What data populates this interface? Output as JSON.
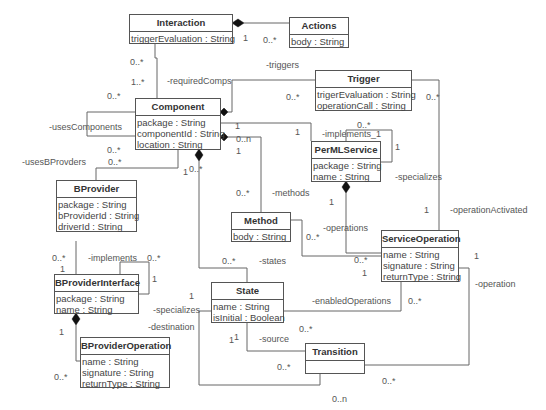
{
  "classes": {
    "interaction": {
      "name": "Interaction",
      "attrs": [
        "triggerEvaluation : String"
      ]
    },
    "actions": {
      "name": "Actions",
      "attrs": [
        "body : String"
      ]
    },
    "trigger": {
      "name": "Trigger",
      "attrs": [
        "trigerEvaluation : String",
        "operationCall : String"
      ]
    },
    "component": {
      "name": "Component",
      "attrs": [
        "package : String",
        "componentId : String",
        "location : String"
      ]
    },
    "permlservice": {
      "name": "PerMLService",
      "attrs": [
        "package : String",
        "name : String"
      ]
    },
    "bprovider": {
      "name": "BProvider",
      "attrs": [
        "package : String",
        "bProviderId : String",
        "driverId : String"
      ]
    },
    "method": {
      "name": "Method",
      "attrs": [
        "body : String"
      ]
    },
    "serviceoperation": {
      "name": "ServiceOperation",
      "attrs": [
        "name : String",
        "signature : String",
        "returnType : String"
      ]
    },
    "bproviderinterface": {
      "name": "BProviderInterface",
      "attrs": [
        "package : String",
        "name : String"
      ]
    },
    "state": {
      "name": "State",
      "attrs": [
        "name : String",
        "isInitial : Boolean"
      ]
    },
    "bprovideroperation": {
      "name": "BProviderOperation",
      "attrs": [
        "name : String",
        "signature : String",
        "returnType : String"
      ]
    },
    "transition": {
      "name": "Transition",
      "attrs": []
    }
  },
  "labels": {
    "roles": {
      "requiredComps": "-requiredComps",
      "triggers": "-triggers",
      "usesComponents": "-usesComponents",
      "usesBProvders": "-usesBProvders",
      "implements_1": "-implements_1",
      "specializes_top": "-specializes",
      "methods": "-methods",
      "operations": "-operations",
      "operationActivated": "-operationActivated",
      "implements": "-implements",
      "states": "-states",
      "specializes_left": "-specializes",
      "destination": "-destination",
      "enabledOperations": "-enabledOperations",
      "operation": "-operation",
      "source": "-source"
    },
    "multiplicities": {
      "m1": "1",
      "m2": "0..*",
      "m3": "0..*",
      "m4": "1..*",
      "m5": "0..*",
      "m6": "0..*",
      "m7": "0..*",
      "m8": "1",
      "m9": "1",
      "m10": "0..n",
      "m11": "1",
      "m12": "0..*",
      "m13": "1",
      "m14": "0..*",
      "m15": "0..*",
      "m16": "1",
      "m17": "0..*",
      "m18": "0..*",
      "m19": "0..*",
      "m20": "1",
      "m21": "1",
      "m22": "0..*",
      "m23": "1",
      "m24": "0..*",
      "m25": "0..*",
      "m26": "1",
      "m27": "1",
      "m28": "0..*",
      "m29": "0..*",
      "m30": "1",
      "m31": "0..*",
      "m32": "0..*",
      "m33": "1",
      "m34": "0..*",
      "m35": "0..*",
      "m36": "0..n",
      "m37": "1",
      "m38": "1",
      "m39": "1"
    }
  }
}
